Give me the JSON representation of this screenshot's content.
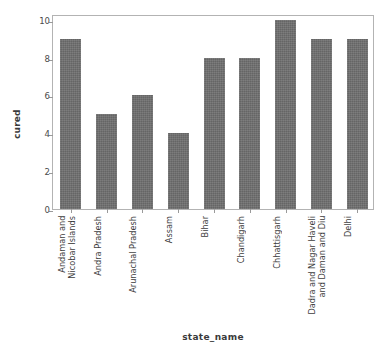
{
  "chart_data": {
    "type": "bar",
    "title": "",
    "xlabel": "state_name",
    "ylabel": "cured",
    "categories": [
      "Andaman and\nNicobar Islands",
      "Andra Pradesh",
      "Arunachal Pradesh",
      "Assam",
      "Bihar",
      "Chandigarh",
      "Chhattisgarh",
      "Dadra and Nagar Haveli\nand Daman and Diu",
      "Delhi"
    ],
    "values": [
      9,
      5,
      6,
      4,
      8,
      8,
      10,
      9,
      9
    ],
    "ylim": [
      0,
      10.3
    ],
    "yticks": [
      0,
      2,
      4,
      6,
      8,
      10
    ],
    "ytick_labels": [
      "0",
      "2",
      "4",
      "6",
      "8",
      "10"
    ],
    "grid": false,
    "legend": false,
    "bar_color": "#6e6e6e",
    "axis_color": "#b3b3b3",
    "background": "#ffffff"
  }
}
